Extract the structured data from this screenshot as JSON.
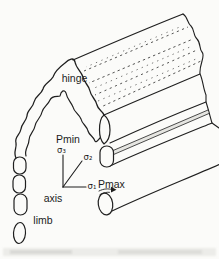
{
  "figure": {
    "kind": "fold-diagram",
    "colors": {
      "paper": "#fbfbf9",
      "ink": "#1f1f1f"
    },
    "labels": {
      "hinge": "hinge",
      "pmin": "Pmin",
      "sigma3": "σ₃",
      "sigma2": "σ₂",
      "sigma1": "σ₁",
      "pmax": "Pmax",
      "axis": "axis",
      "limb": "limb"
    }
  }
}
